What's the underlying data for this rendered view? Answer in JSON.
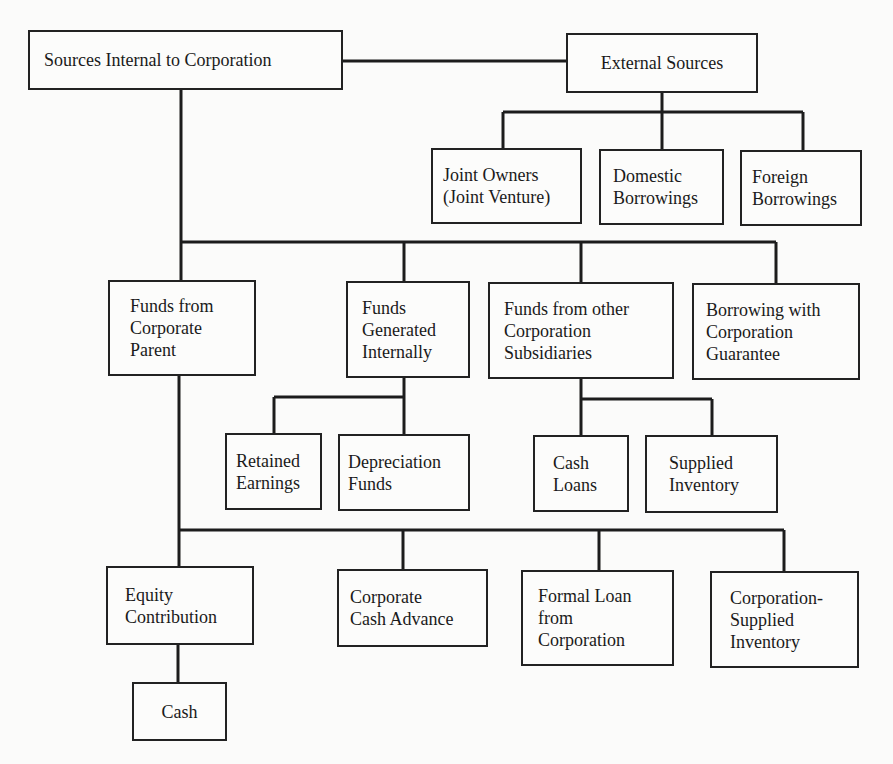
{
  "nodes": {
    "internal": {
      "lines": [
        "Sources Internal to Corporation"
      ]
    },
    "external": {
      "lines": [
        "External Sources"
      ]
    },
    "joint_owners": {
      "lines": [
        "Joint Owners",
        "(Joint Venture)"
      ]
    },
    "domestic": {
      "lines": [
        "Domestic",
        "Borrowings"
      ]
    },
    "foreign": {
      "lines": [
        "Foreign",
        "Borrowings"
      ]
    },
    "parent": {
      "lines": [
        "Funds from",
        "Corporate",
        "Parent"
      ]
    },
    "generated": {
      "lines": [
        "Funds",
        "Generated",
        "Internally"
      ]
    },
    "subsidiaries": {
      "lines": [
        "Funds from other",
        "Corporation",
        "Subsidiaries"
      ]
    },
    "guarantee": {
      "lines": [
        "Borrowing with",
        "Corporation",
        "Guarantee"
      ]
    },
    "retained": {
      "lines": [
        "Retained",
        "Earnings"
      ]
    },
    "depreciation": {
      "lines": [
        "Depreciation",
        "Funds"
      ]
    },
    "cash_loans": {
      "lines": [
        "Cash",
        "Loans"
      ]
    },
    "supplied_inv": {
      "lines": [
        "Supplied",
        "Inventory"
      ]
    },
    "equity": {
      "lines": [
        "Equity",
        "Contribution"
      ]
    },
    "cash_advance": {
      "lines": [
        "Corporate",
        "Cash Advance"
      ]
    },
    "formal_loan": {
      "lines": [
        "Formal Loan",
        "from",
        "Corporation"
      ]
    },
    "corp_inventory": {
      "lines": [
        "Corporation-",
        "Supplied",
        "Inventory"
      ]
    },
    "cash": {
      "lines": [
        "Cash"
      ]
    }
  }
}
